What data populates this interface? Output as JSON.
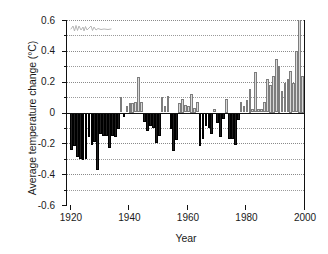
{
  "chart_data": {
    "type": "bar",
    "title": "",
    "xlabel": "Year",
    "ylabel": "Average temperature change (°C)",
    "xlim": [
      1919,
      2000
    ],
    "ylim": [
      -0.6,
      0.6
    ],
    "ytick_labels": [
      "0.6",
      "0.4",
      "0.2",
      "0",
      "-0.2",
      "-0.4",
      "-0.6"
    ],
    "ytick_values": [
      0.6,
      0.4,
      0.2,
      0,
      -0.2,
      -0.4,
      -0.6
    ],
    "yminor_values": [
      0.5,
      0.3,
      0.1,
      -0.1,
      -0.3,
      -0.5
    ],
    "xtick_labels": [
      "1920",
      "1940",
      "1960",
      "1980",
      "2000"
    ],
    "xtick_values": [
      1920,
      1940,
      1960,
      1980,
      2000
    ],
    "grid": "horizontal-dotted",
    "legend": "none",
    "colors": {
      "negative_bar": "#201f1f",
      "positive_bar": "#d9d9d9",
      "positive_bar_edge": "#7d7d7d",
      "axis": "#111111",
      "gridline": "#9a9a9a",
      "background": "#ffffff"
    },
    "annotations": [
      {
        "name": "scan-squiggle-artifact",
        "description": "faint pen-like squiggle mark near top-left of plot area"
      }
    ],
    "categories": [
      1920,
      1921,
      1922,
      1923,
      1924,
      1925,
      1926,
      1927,
      1928,
      1929,
      1930,
      1931,
      1932,
      1933,
      1934,
      1935,
      1936,
      1937,
      1938,
      1939,
      1940,
      1941,
      1942,
      1943,
      1944,
      1945,
      1946,
      1947,
      1948,
      1949,
      1950,
      1951,
      1952,
      1953,
      1954,
      1955,
      1956,
      1957,
      1958,
      1959,
      1960,
      1961,
      1962,
      1963,
      1964,
      1965,
      1966,
      1967,
      1968,
      1969,
      1970,
      1971,
      1972,
      1973,
      1974,
      1975,
      1976,
      1977,
      1978,
      1979,
      1980,
      1981,
      1982,
      1983,
      1984,
      1985,
      1986,
      1987,
      1988,
      1989,
      1990,
      1991,
      1992,
      1993,
      1994,
      1995,
      1996,
      1997,
      1998,
      1999
    ],
    "values": [
      -0.24,
      -0.22,
      -0.29,
      -0.3,
      -0.31,
      -0.3,
      -0.16,
      -0.21,
      -0.19,
      -0.37,
      -0.14,
      -0.15,
      -0.15,
      -0.23,
      -0.15,
      -0.16,
      -0.11,
      0.1,
      -0.03,
      0.04,
      0.06,
      0.06,
      0.07,
      0.23,
      0.07,
      -0.06,
      -0.12,
      -0.09,
      -0.1,
      -0.2,
      -0.15,
      0.1,
      0.04,
      0.11,
      -0.11,
      -0.25,
      -0.18,
      0.06,
      0.09,
      0.05,
      0.04,
      0.12,
      0.03,
      0.07,
      -0.22,
      -0.17,
      -0.09,
      -0.1,
      -0.14,
      0.02,
      -0.07,
      -0.16,
      -0.04,
      0.09,
      -0.17,
      -0.17,
      -0.21,
      -0.05,
      0.07,
      0.04,
      0.08,
      0.15,
      0.02,
      0.26,
      0.02,
      0.02,
      0.07,
      0.22,
      0.18,
      0.24,
      0.35,
      0.3,
      0.14,
      0.19,
      0.22,
      0.27,
      0.19,
      0.4,
      0.61,
      0.24
    ]
  }
}
